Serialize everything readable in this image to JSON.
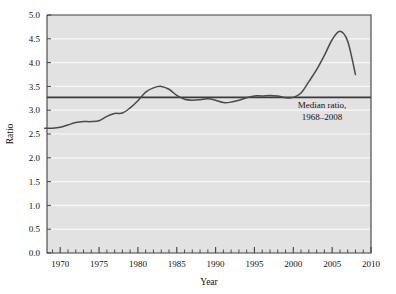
{
  "chart_data": {
    "type": "line",
    "title": "",
    "xlabel": "Year",
    "ylabel": "Ratio",
    "xlim": [
      1968.3,
      2010
    ],
    "ylim": [
      0.0,
      5.0
    ],
    "grid": true,
    "grid_orientation": "horizontal",
    "legend": "none",
    "x_ticks_major": [
      1970,
      1975,
      1980,
      1985,
      1990,
      1995,
      2000,
      2005,
      2010
    ],
    "x_tick_labels": [
      "1970",
      "1975",
      "1980",
      "1985",
      "1990",
      "1995",
      "2000",
      "2005",
      "2010"
    ],
    "x_ticks_minor_step": 1,
    "y_ticks": [
      0.0,
      0.5,
      1.0,
      1.5,
      2.0,
      2.5,
      3.0,
      3.5,
      4.0,
      4.5,
      5.0
    ],
    "y_tick_labels": [
      "0.0",
      "0.5",
      "1.0",
      "1.5",
      "2.0",
      "2.5",
      "3.0",
      "3.5",
      "4.0",
      "4.5",
      "5.0"
    ],
    "series": [
      {
        "name": "Ratio",
        "color": "#4a4a4a",
        "x": [
          1968,
          1969,
          1970,
          1971,
          1972,
          1973,
          1974,
          1975,
          1976,
          1977,
          1978,
          1979,
          1980,
          1981,
          1982,
          1983,
          1984,
          1985,
          1986,
          1987,
          1988,
          1989,
          1990,
          1991,
          1992,
          1993,
          1994,
          1995,
          1996,
          1997,
          1998,
          1999,
          2000,
          2001,
          2002,
          2003,
          2004,
          2005,
          2006,
          2007,
          2008
        ],
        "values": [
          2.62,
          2.62,
          2.64,
          2.69,
          2.74,
          2.76,
          2.76,
          2.78,
          2.87,
          2.93,
          2.94,
          3.05,
          3.2,
          3.38,
          3.47,
          3.5,
          3.44,
          3.31,
          3.23,
          3.21,
          3.22,
          3.24,
          3.21,
          3.16,
          3.17,
          3.21,
          3.26,
          3.3,
          3.3,
          3.31,
          3.3,
          3.26,
          3.27,
          3.36,
          3.6,
          3.85,
          4.15,
          4.48,
          4.66,
          4.45,
          3.75
        ]
      }
    ],
    "reference_line": {
      "name": "median-ratio-line",
      "value": 3.27,
      "color": "#3a3a3a",
      "annotation_line1": "Median ratio,",
      "annotation_line2": "1968–2008"
    },
    "style": {
      "plot_background": "#e2e2e2",
      "gridline_color": "#f7f7f7",
      "axis_color": "#404040",
      "page_background": "#ffffff"
    }
  }
}
